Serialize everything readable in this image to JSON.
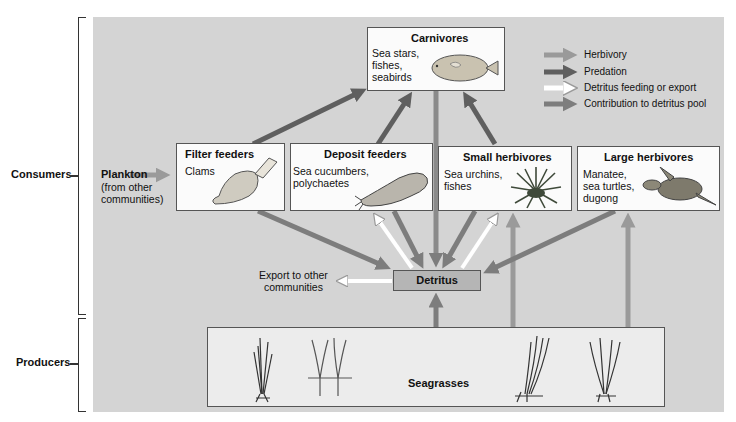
{
  "sides": {
    "consumers": "Consumers",
    "producers": "Producers"
  },
  "legend": {
    "items": [
      {
        "label": "Herbivory",
        "color": "#9a9a9a"
      },
      {
        "label": "Predation",
        "color": "#5f5f5f"
      },
      {
        "label": "Detritus feeding or export",
        "color": "#ffffff"
      },
      {
        "label": "Contribution to detritus pool",
        "color": "#7d7d7d"
      }
    ]
  },
  "nodes": {
    "carnivores": {
      "title": "Carnivores",
      "text": "Sea stars,\nfishes,\nseabirds",
      "icon": "flatfish"
    },
    "plankton": {
      "title": "Plankton",
      "text": "(from other\ncommunities)"
    },
    "filter_feeders": {
      "title": "Filter feeders",
      "text": "Clams",
      "icon": "clam"
    },
    "deposit_feeders": {
      "title": "Deposit feeders",
      "text": "Sea cucumbers,\npolychaetes",
      "icon": "sea-cucumber"
    },
    "small_herbivores": {
      "title": "Small herbivores",
      "text": "Sea urchins,\nfishes",
      "icon": "sea-urchin"
    },
    "large_herbivores": {
      "title": "Large herbivores",
      "text": "Manatee,\nsea turtles,\ndugong",
      "icon": "sea-turtle"
    },
    "detritus": {
      "title": "Detritus"
    },
    "export": {
      "text": "Export to other\ncommunities"
    },
    "seagrasses": {
      "title": "Seagrasses",
      "icon": "seagrass"
    }
  },
  "colors": {
    "panel": "#d4d4d4",
    "herbivory": "#9a9a9a",
    "predation": "#5f5f5f",
    "detritus_feeding": "#ffffff",
    "contribution": "#7d7d7d"
  }
}
